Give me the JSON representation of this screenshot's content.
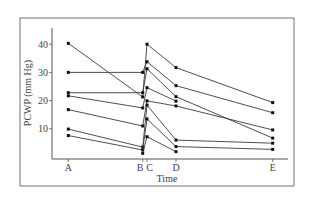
{
  "chart_data": {
    "type": "line",
    "title": "",
    "xlabel": "Time",
    "ylabel": "PCWP (mm Hg)",
    "x_categories": [
      "A",
      "B",
      "C",
      "D",
      "E"
    ],
    "x_positions": {
      "A": 0,
      "B": 0.77,
      "C": 0.815,
      "D": 1.115,
      "E": 2.115
    },
    "yticks": [
      10,
      20,
      30,
      40
    ],
    "ylim": [
      0,
      46
    ],
    "grid": false,
    "legend": null,
    "series": [
      {
        "name": "patient-1",
        "values": {
          "A": 40.3,
          "B": 21.3,
          "C": 40.0,
          "D": 31.7,
          "E": 19.3
        }
      },
      {
        "name": "patient-2",
        "values": {
          "A": 30.0,
          "B": 30.0,
          "C": 33.8,
          "D": 25.3,
          "E": 15.7
        }
      },
      {
        "name": "patient-3",
        "values": {
          "A": 22.8,
          "B": 22.8,
          "C": 31.3,
          "D": 21.4,
          "E": 6.7
        }
      },
      {
        "name": "patient-4",
        "values": {
          "A": 21.7,
          "B": 17.4,
          "C": 24.6,
          "D": 19.8,
          "E": null
        }
      },
      {
        "name": "patient-5",
        "values": {
          "A": 16.8,
          "B": 11.0,
          "C": 19.9,
          "D": 18.1,
          "E": 9.6
        }
      },
      {
        "name": "patient-6",
        "values": {
          "A": 9.9,
          "B": 3.5,
          "C": 18.4,
          "D": 6.0,
          "E": 4.9
        }
      },
      {
        "name": "patient-7",
        "values": {
          "A": 7.6,
          "B": 2.5,
          "C": 13.5,
          "D": 3.7,
          "E": 2.7
        }
      },
      {
        "name": "patient-8",
        "values": {
          "A": null,
          "B": 1.3,
          "C": 7.2,
          "D": 1.9,
          "E": null
        }
      }
    ]
  },
  "layout": {
    "frame": {
      "x": 20,
      "y": 18,
      "w": 274,
      "h": 168
    },
    "plot": {
      "x0": 52,
      "y_top": 28,
      "y_axis": 159,
      "x_end": 288
    },
    "y_zero_px": 157,
    "px_per_unit": 2.82,
    "x_px": {
      "A": 68.3,
      "B": 142.7,
      "C": 147,
      "D": 176,
      "E": 272.7
    }
  },
  "colors": {
    "line": "#3a3a3a",
    "point": "#111111",
    "axis": "#555555",
    "frame": "#8a8a8a",
    "text": "#444444"
  }
}
